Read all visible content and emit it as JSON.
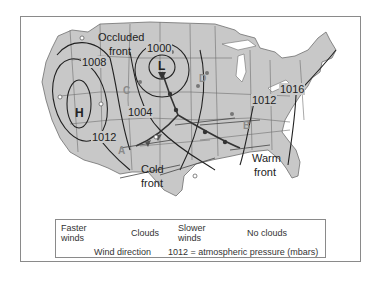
{
  "map": {
    "pressure_systems": [
      {
        "symbol": "H",
        "type": "high"
      },
      {
        "symbol": "L",
        "type": "low"
      }
    ],
    "isobars": [
      "1000",
      "1004",
      "1008",
      "1012",
      "1012",
      "1016"
    ],
    "front_labels": {
      "occluded_line1": "Occluded",
      "occluded_line2": "front",
      "cold_line1": "Cold",
      "cold_line2": "front",
      "warm_line1": "Warm",
      "warm_line2": "front"
    },
    "station_letters": [
      "A",
      "B",
      "C",
      "D"
    ],
    "colors": {
      "land": "#c8c8c8",
      "borders": "#6e6e6e",
      "isobar": "#222222",
      "water": "#ffffff",
      "letters": "#8a8a8a"
    }
  },
  "legend": {
    "faster_winds_line1": "Faster",
    "faster_winds_line2": "winds",
    "clouds_label": "Clouds",
    "slower_winds_line1": "Slower",
    "slower_winds_line2": "winds",
    "no_clouds_label": "No clouds",
    "wind_direction_label": "Wind direction",
    "pressure_note": "1012 = atmospheric pressure (mbars)"
  }
}
